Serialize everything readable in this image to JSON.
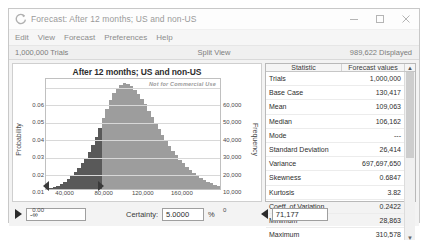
{
  "window": {
    "title": "Forecast: After 12 months; US and non-US",
    "app_icon": "crystal-ball-icon",
    "controls": {
      "minimize": "minimize-icon",
      "maximize": "maximize-icon",
      "close": "close-icon"
    }
  },
  "menu": {
    "items": [
      "Edit",
      "View",
      "Forecast",
      "Preferences",
      "Help"
    ]
  },
  "status": {
    "left": "1,000,000 Trials",
    "middle": "Split View",
    "right": "989,622 Displayed"
  },
  "chart_data": {
    "type": "bar",
    "title": "After 12 months; US and non-US",
    "watermark": "Not for Commercial Use",
    "xlabel": "",
    "ylabel": "Probability",
    "y2label": "Frequency",
    "xticks": [
      "40,000",
      "80,000",
      "120,000",
      "160,000"
    ],
    "xtick_values": [
      40000,
      80000,
      120000,
      160000
    ],
    "yticks": [
      "0.06",
      "0.05",
      "0.04",
      "0.03",
      "0.02",
      "0.01",
      "0.00"
    ],
    "ytick_values": [
      0.06,
      0.05,
      0.04,
      0.03,
      0.02,
      0.01,
      0.0
    ],
    "y2ticks": [
      "60,000",
      "50,000",
      "40,000",
      "30,000",
      "20,000",
      "10,000",
      "0"
    ],
    "y2tick_values": [
      60000,
      50000,
      40000,
      30000,
      20000,
      10000,
      0
    ],
    "ylim": [
      0,
      0.065
    ],
    "y2lim": [
      0,
      65000
    ],
    "xlim": [
      20000,
      200000
    ],
    "grid": true,
    "legend": "none",
    "categories": [
      "22000",
      "25600",
      "29200",
      "32800",
      "36400",
      "40000",
      "43600",
      "47200",
      "50800",
      "54400",
      "58000",
      "61600",
      "65200",
      "68800",
      "72400",
      "76000",
      "79600",
      "83200",
      "86800",
      "90400",
      "94000",
      "97600",
      "101200",
      "104800",
      "108400",
      "112000",
      "115600",
      "119200",
      "122800",
      "126400",
      "130000",
      "133600",
      "137200",
      "140800",
      "144400",
      "148000",
      "151600",
      "155200",
      "158800",
      "162400",
      "166000",
      "169600",
      "173200",
      "176800",
      "180400",
      "184000",
      "187600",
      "191200",
      "194800",
      "198400"
    ],
    "values": [
      300,
      600,
      1100,
      1900,
      2900,
      4200,
      5800,
      7600,
      9700,
      12000,
      14800,
      17900,
      21500,
      25600,
      30200,
      35500,
      41000,
      46500,
      51500,
      55500,
      58500,
      60500,
      61200,
      60800,
      59500,
      57500,
      55000,
      52000,
      49000,
      45500,
      42000,
      38500,
      35000,
      31500,
      28000,
      25000,
      22000,
      19500,
      17000,
      14800,
      12800,
      11000,
      9300,
      7800,
      6500,
      5300,
      4300,
      3400,
      2600,
      1900
    ],
    "series_note": "darker bars mark the lower certainty tail below the grabber",
    "dark_bar_count": 16
  },
  "stats": {
    "headers": [
      "Statistic",
      "Forecast values"
    ],
    "scroll_up_icon": "chevron-up-icon",
    "scroll_down_icon": "chevron-down-icon",
    "rows": [
      {
        "name": "Trials",
        "value": "1,000,000"
      },
      {
        "name": "Base Case",
        "value": "130,417"
      },
      {
        "name": "Mean",
        "value": "109,063"
      },
      {
        "name": "Median",
        "value": "106,162"
      },
      {
        "name": "Mode",
        "value": "---"
      },
      {
        "name": "Standard Deviation",
        "value": "26,414"
      },
      {
        "name": "Variance",
        "value": "697,697,650"
      },
      {
        "name": "Skewness",
        "value": "0.6847"
      },
      {
        "name": "Kurtosis",
        "value": "3.82"
      },
      {
        "name": "Coeff. of Variation",
        "value": "0.2422"
      },
      {
        "name": "Minimum",
        "value": "28,863"
      },
      {
        "name": "Maximum",
        "value": "310,578"
      }
    ]
  },
  "bottom": {
    "lower_grabber_icon": "triangle-right-icon",
    "lower_value": "-∞",
    "certainty_label": "Certainty:",
    "certainty_value": "5.0000",
    "percent_symbol": "%",
    "upper_grabber_icon": "triangle-left-icon",
    "upper_value": "71,177"
  }
}
